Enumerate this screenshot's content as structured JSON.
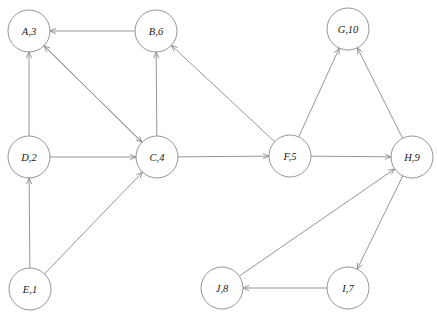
{
  "diagram": {
    "type": "directed-graph",
    "width": 437,
    "height": 312,
    "background_color": "#ffffff",
    "node_stroke_color": "#8a8a8a",
    "edge_stroke_color": "#8a8a8a",
    "label_color": "#1a1a1a",
    "node_radius": 21
  },
  "nodes": [
    {
      "id": "A",
      "label": "A,3",
      "letter": "A",
      "number": 3,
      "cx": 29,
      "cy": 31
    },
    {
      "id": "B",
      "label": "B,6",
      "letter": "B",
      "number": 6,
      "cx": 156,
      "cy": 31
    },
    {
      "id": "G",
      "label": "G,10",
      "letter": "G",
      "number": 10,
      "cx": 348,
      "cy": 29
    },
    {
      "id": "D",
      "label": "D,2",
      "letter": "D",
      "number": 2,
      "cx": 29,
      "cy": 157
    },
    {
      "id": "C",
      "label": "C,4",
      "letter": "C",
      "number": 4,
      "cx": 157,
      "cy": 157
    },
    {
      "id": "F",
      "label": "F,5",
      "letter": "F",
      "number": 5,
      "cx": 290,
      "cy": 156
    },
    {
      "id": "H",
      "label": "H,9",
      "letter": "H",
      "number": 9,
      "cx": 412,
      "cy": 157
    },
    {
      "id": "E",
      "label": "E,1",
      "letter": "E",
      "number": 1,
      "cx": 30,
      "cy": 289
    },
    {
      "id": "J",
      "label": "J,8",
      "letter": "J",
      "number": 8,
      "cx": 222,
      "cy": 288
    },
    {
      "id": "I",
      "label": "I,7",
      "letter": "I",
      "number": 7,
      "cx": 348,
      "cy": 288
    }
  ],
  "edges": [
    {
      "from": "B",
      "to": "A",
      "directed": true
    },
    {
      "from": "C",
      "to": "A",
      "directed": true
    },
    {
      "from": "D",
      "to": "A",
      "directed": true
    },
    {
      "from": "C",
      "to": "B",
      "directed": true
    },
    {
      "from": "F",
      "to": "B",
      "directed": true
    },
    {
      "from": "A",
      "to": "C",
      "directed": true
    },
    {
      "from": "D",
      "to": "C",
      "directed": true
    },
    {
      "from": "E",
      "to": "C",
      "directed": true
    },
    {
      "from": "E",
      "to": "D",
      "directed": true
    },
    {
      "from": "C",
      "to": "F",
      "directed": true
    },
    {
      "from": "F",
      "to": "G",
      "directed": true
    },
    {
      "from": "H",
      "to": "G",
      "directed": true
    },
    {
      "from": "F",
      "to": "H",
      "directed": true
    },
    {
      "from": "J",
      "to": "H",
      "directed": true
    },
    {
      "from": "H",
      "to": "I",
      "directed": true
    },
    {
      "from": "I",
      "to": "J",
      "directed": true
    }
  ]
}
